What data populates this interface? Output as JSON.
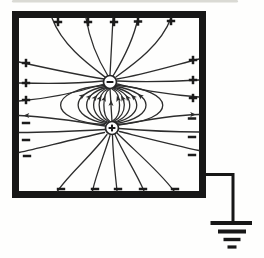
{
  "figure": {
    "ink": "#2d2d2d",
    "frame_ink": "#171717",
    "symbol_ink": "#1b1b1b",
    "paper": "#fefefd",
    "scan_artifact": {
      "x": 12,
      "y": 0,
      "width": 226,
      "height": 2.6,
      "color": "#c6c6bf",
      "opacity": 0.65
    },
    "box": {
      "x": 15.5,
      "y": 14.5,
      "width": 187,
      "height": 180,
      "stroke_width": 7
    },
    "charges": [
      {
        "name": "negative-charge",
        "symbol": "-",
        "cx": 110,
        "cy": 82,
        "r": 6.5
      },
      {
        "name": "positive-charge",
        "symbol": "+",
        "cx": 112,
        "cy": 128,
        "r": 6.5
      }
    ],
    "wall_charges": [
      {
        "symbol": "+",
        "x": 58,
        "y": 22
      },
      {
        "symbol": "+",
        "x": 88,
        "y": 22
      },
      {
        "symbol": "+",
        "x": 114,
        "y": 22
      },
      {
        "symbol": "+",
        "x": 138,
        "y": 21.5
      },
      {
        "symbol": "+",
        "x": 171,
        "y": 21
      },
      {
        "symbol": "+",
        "x": 26,
        "y": 63
      },
      {
        "symbol": "+",
        "x": 26,
        "y": 83
      },
      {
        "symbol": "+",
        "x": 26,
        "y": 100
      },
      {
        "symbol": "-",
        "x": 26,
        "y": 123
      },
      {
        "symbol": "-",
        "x": 26,
        "y": 140
      },
      {
        "symbol": "-",
        "x": 27,
        "y": 156
      },
      {
        "symbol": "+",
        "x": 193,
        "y": 60
      },
      {
        "symbol": "+",
        "x": 193,
        "y": 80
      },
      {
        "symbol": "+",
        "x": 193,
        "y": 98
      },
      {
        "symbol": "-",
        "x": 192,
        "y": 118.5
      },
      {
        "symbol": "-",
        "x": 192,
        "y": 137
      },
      {
        "symbol": "-",
        "x": 192,
        "y": 155
      },
      {
        "symbol": "-",
        "x": 61,
        "y": 189
      },
      {
        "symbol": "-",
        "x": 95,
        "y": 189
      },
      {
        "symbol": "-",
        "x": 118,
        "y": 189
      },
      {
        "symbol": "-",
        "x": 143,
        "y": 189
      },
      {
        "symbol": "-",
        "x": 175,
        "y": 189
      }
    ],
    "field_lines": [
      "M 52 18 C 62 45 88 64 105 77",
      "M 86 18 C 90 42 100 63 108 76",
      "M 113 18 C 112 40 111 58 110 75",
      "M 138 18 C 133 42 121 63 113 76",
      "M 171 18 C 161 45 134 64 116 77",
      "M 19 62 C 55 70 85 76 104 79",
      "M 19 83 C 55 84 85 83 103.5 81",
      "M 19 101 C 55 98 85 90 104 84",
      "M 199 59 C 165 68 138 76 117 79",
      "M 199 80 C 165 82 142 82 117.5 81",
      "M 199 97 C 165 95 140 89 117 84",
      "M 110 88.5 L 112 121.5",
      "M 109.5 121 C 102 116 102 94 109.5 89",
      "M 108.5 121.5 C 96 115 96 94.5 108.5 88.5",
      "M 107.5 122 C 89 115.5 89 94.5 107.5 88",
      "M 106.5 122.5 C 80 116 80 94 106.5 87.5",
      "M 105.5 123.5 C 69 117 69 93 105.5 86.5",
      "M 104.5 124.5 C 46 121 46 89.5 104.5 85.5",
      "M 112.5 121 C 122 116 122 94 112 89",
      "M 113.5 121.5 C 128 115 128 94.5 113 88.5",
      "M 114.5 122 C 135 115.5 135 94.5 113.5 88",
      "M 115.5 122.5 C 144 116 144 94 114.5 87.5",
      "M 116.5 123.5 C 156 117 156 93 115.5 86.5",
      "M 117.5 124.5 C 178 121 178 89.5 116.5 85.5",
      "M 105 126 C 70 120 40 116.5 19 115.5",
      "M 105 129.5 C 70 131.5 40 132.5 19 132.5",
      "M 104.5 132.5 C 70 140 40 148 19 152.5",
      "M 119 125 C 150 119 180 115 199 114.5",
      "M 119 128.5 C 150 131 180 132 199 132",
      "M 119.5 131.5 C 150 139 180 146.5 199 150.5",
      "M 107 134.5 C 92 155 71 172 57.5 191",
      "M 110 135.5 C 103 158 96 175 92.5 191",
      "M 112.5 135.5 C 113 158 115.5 175 117 191",
      "M 115 134.5 C 124 155 136 172 144 191",
      "M 117.5 133.5 C 136 152 158 170 174 191"
    ],
    "arrows": [
      {
        "x": 105.3,
        "y": 95.7,
        "rot": -72
      },
      {
        "x": 101.5,
        "y": 95.4,
        "rot": -61
      },
      {
        "x": 97.1,
        "y": 95.1,
        "rot": -52
      },
      {
        "x": 91.6,
        "y": 94.8,
        "rot": -43
      },
      {
        "x": 84.9,
        "y": 94.1,
        "rot": -36
      },
      {
        "x": 111.2,
        "y": 100,
        "rot": -88
      },
      {
        "x": 116.9,
        "y": 95.7,
        "rot": -108
      },
      {
        "x": 121,
        "y": 95.4,
        "rot": -119
      },
      {
        "x": 125.5,
        "y": 95.1,
        "rot": -128
      },
      {
        "x": 131,
        "y": 94.8,
        "rot": -137
      },
      {
        "x": 137.7,
        "y": 94.1,
        "rot": -144
      },
      {
        "x": 23.5,
        "y": 115.4,
        "rot": 180
      },
      {
        "x": 196,
        "y": 114.6,
        "rot": 0
      }
    ],
    "ground": {
      "wire_path": "M 202 174.5 L 233 174.5 L 233 221",
      "wire_width": 3,
      "bars": [
        {
          "x1": 210.5,
          "x2": 252,
          "y": 223,
          "w": 4.2
        },
        {
          "x1": 218,
          "x2": 246,
          "y": 231.5,
          "w": 4
        },
        {
          "x1": 223.5,
          "x2": 240.5,
          "y": 239.5,
          "w": 3.4
        },
        {
          "x1": 227.5,
          "x2": 236.5,
          "y": 247,
          "w": 3.2
        }
      ]
    }
  }
}
